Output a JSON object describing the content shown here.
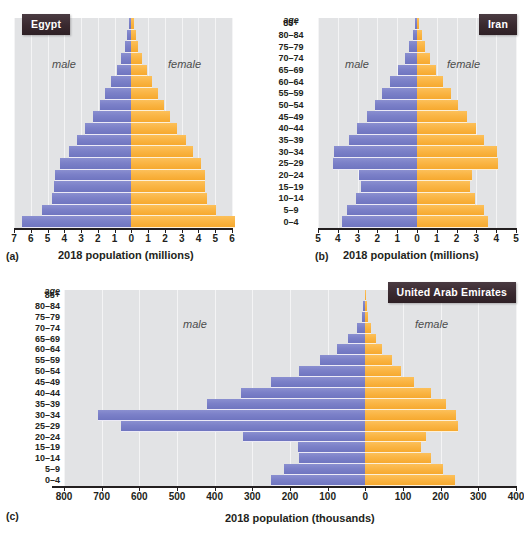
{
  "figure": {
    "age_header": "age",
    "age_groups": [
      "85+",
      "80–84",
      "75–79",
      "70–74",
      "65–69",
      "60–64",
      "55–59",
      "50–54",
      "45–49",
      "40–44",
      "35–39",
      "30–34",
      "25–29",
      "20–24",
      "15–19",
      "10–14",
      "5–9",
      "0–4"
    ],
    "male_label": "male",
    "female_label": "female",
    "colors": {
      "male_bar": "#7b80c8",
      "female_bar": "#f7ae38",
      "plot_background": "#e2e3e5",
      "gridline": "#f4f4f5",
      "badge_background": "#39292f",
      "badge_text": "#ffffff",
      "page_background": "#ffffff",
      "axis": "#231f20"
    }
  },
  "panels": [
    {
      "letter": "(a)",
      "country": "Egypt",
      "axis_title": "2018 population (millions)",
      "unit": "millions"
    },
    {
      "letter": "(b)",
      "country": "Iran",
      "axis_title": "2018 population (millions)",
      "unit": "millions"
    },
    {
      "letter": "(c)",
      "country": "United Arab Emirates",
      "axis_title": "2018 population (thousands)",
      "unit": "thousands"
    }
  ],
  "chart_data": [
    {
      "type": "bar",
      "subtype": "population-pyramid",
      "panel": "(a)",
      "title": "Egypt",
      "xlabel": "2018 population (millions)",
      "ylabel": "age",
      "unit": "millions",
      "grid": true,
      "legend_position": "inside-plot",
      "categories": [
        "85+",
        "80–84",
        "75–79",
        "70–74",
        "65–69",
        "60–64",
        "55–59",
        "50–54",
        "45–49",
        "40–44",
        "35–39",
        "30–34",
        "25–29",
        "20–24",
        "15–19",
        "10–14",
        "5–9",
        "0–4"
      ],
      "left_axis_ticks": [
        7,
        6,
        5,
        4,
        3,
        2,
        1,
        0
      ],
      "right_axis_ticks": [
        0,
        1,
        2,
        3,
        4,
        5,
        6
      ],
      "xlim_left": 7,
      "xlim_right": 6,
      "series": [
        {
          "name": "male",
          "side": "left",
          "values": [
            0.12,
            0.25,
            0.38,
            0.62,
            0.88,
            1.2,
            1.55,
            1.9,
            2.3,
            2.75,
            3.25,
            3.75,
            4.25,
            4.55,
            4.6,
            4.75,
            5.35,
            6.5
          ]
        },
        {
          "name": "female",
          "side": "right",
          "values": [
            0.14,
            0.28,
            0.42,
            0.66,
            0.92,
            1.22,
            1.58,
            1.92,
            2.32,
            2.75,
            3.25,
            3.7,
            4.15,
            4.4,
            4.4,
            4.5,
            5.05,
            6.15
          ]
        }
      ]
    },
    {
      "type": "bar",
      "subtype": "population-pyramid",
      "panel": "(b)",
      "title": "Iran",
      "xlabel": "2018 population (millions)",
      "ylabel": "age",
      "unit": "millions",
      "grid": true,
      "legend_position": "inside-plot",
      "categories": [
        "85+",
        "80–84",
        "75–79",
        "70–74",
        "65–69",
        "60–64",
        "55–59",
        "50–54",
        "45–49",
        "40–44",
        "35–39",
        "30–34",
        "25–29",
        "20–24",
        "15–19",
        "10–14",
        "5–9",
        "0–4"
      ],
      "left_axis_ticks": [
        5,
        4,
        3,
        2,
        1,
        0
      ],
      "right_axis_ticks": [
        0,
        1,
        2,
        3,
        4,
        5
      ],
      "xlim_left": 5,
      "xlim_right": 5,
      "series": [
        {
          "name": "male",
          "side": "left",
          "values": [
            0.1,
            0.22,
            0.38,
            0.62,
            0.95,
            1.35,
            1.75,
            2.1,
            2.55,
            3.05,
            3.45,
            4.2,
            4.25,
            2.95,
            2.85,
            3.1,
            3.55,
            3.8
          ]
        },
        {
          "name": "female",
          "side": "right",
          "values": [
            0.12,
            0.25,
            0.4,
            0.64,
            0.96,
            1.33,
            1.72,
            2.08,
            2.5,
            3.0,
            3.4,
            4.05,
            4.1,
            2.8,
            2.7,
            2.95,
            3.4,
            3.6
          ]
        }
      ]
    },
    {
      "type": "bar",
      "subtype": "population-pyramid",
      "panel": "(c)",
      "title": "United Arab Emirates",
      "xlabel": "2018 population (thousands)",
      "ylabel": "age",
      "unit": "thousands",
      "grid": true,
      "legend_position": "inside-plot",
      "categories": [
        "85+",
        "80–84",
        "75–79",
        "70–74",
        "65–69",
        "60–64",
        "55–59",
        "50–54",
        "45–49",
        "40–44",
        "35–39",
        "30–34",
        "25–29",
        "20–24",
        "15–19",
        "10–14",
        "5–9",
        "0–4"
      ],
      "left_axis_ticks": [
        800,
        700,
        600,
        500,
        400,
        300,
        200,
        100,
        0
      ],
      "right_axis_ticks": [
        0,
        100,
        200,
        300,
        400
      ],
      "xlim_left": 800,
      "xlim_right": 400,
      "series": [
        {
          "name": "male",
          "side": "left",
          "values": [
            2,
            5,
            10,
            22,
            45,
            75,
            120,
            175,
            250,
            330,
            420,
            710,
            650,
            325,
            180,
            175,
            215,
            250
          ]
        },
        {
          "name": "female",
          "side": "right",
          "values": [
            2,
            4,
            8,
            16,
            28,
            45,
            70,
            95,
            130,
            175,
            215,
            240,
            245,
            160,
            148,
            175,
            205,
            238
          ]
        }
      ]
    }
  ]
}
